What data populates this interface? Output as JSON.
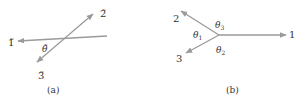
{
  "colors": {
    "line": "#9a9a9a",
    "text": "#333333",
    "background": "#ffffff"
  },
  "panel_a": {
    "caption": "(a)",
    "labels": {
      "one": "1̃",
      "two": "2̃",
      "three": "3̃",
      "theta": "θ̃"
    }
  },
  "panel_b": {
    "caption": "(b)",
    "labels": {
      "one": "1",
      "two": "2",
      "three": "3",
      "theta1": "θ",
      "theta1_sub": "1",
      "theta2": "θ",
      "theta2_sub": "2",
      "theta3": "θ",
      "theta3_sub": "3"
    }
  }
}
